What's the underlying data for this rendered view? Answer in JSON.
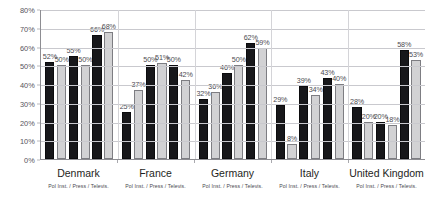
{
  "chart_data": {
    "type": "bar",
    "title": "",
    "xlabel": "",
    "ylabel": "",
    "ylim": [
      0,
      80
    ],
    "grid": true,
    "legend_position": "none",
    "categories": [
      "Denmark",
      "France",
      "Germany",
      "Italy",
      "United Kingdom"
    ],
    "subcategory_label": "Pol Inst. / Press / Televis.",
    "subcategories": [
      "Pol Inst.",
      "Press",
      "Televis."
    ],
    "series": [
      {
        "name": "Series 1",
        "style": "dark",
        "values": [
          52,
          25,
          32,
          29,
          28
        ]
      },
      {
        "name": "Series 2",
        "style": "light",
        "values": [
          50,
          37,
          36,
          8,
          20
        ]
      },
      {
        "name": "Series 3",
        "style": "dark",
        "values": [
          55,
          50,
          46,
          39,
          20
        ]
      },
      {
        "name": "Series 4",
        "style": "light",
        "values": [
          50,
          51,
          50,
          34,
          18
        ]
      },
      {
        "name": "Series 5",
        "style": "dark",
        "values": [
          66,
          50,
          62,
          43,
          58
        ]
      },
      {
        "name": "Series 6",
        "style": "light",
        "values": [
          68,
          42,
          59,
          40,
          53
        ]
      }
    ],
    "groups": [
      {
        "name": "Denmark",
        "sub_label": "Pol Inst. / Press / Televis.",
        "bars": [
          {
            "value": 52,
            "label": "52%",
            "style": "dark"
          },
          {
            "value": 50,
            "label": "50%",
            "style": "light"
          },
          {
            "value": 55,
            "label": "55%",
            "style": "dark"
          },
          {
            "value": 50,
            "label": "50%",
            "style": "light"
          },
          {
            "value": 66,
            "label": "66%",
            "style": "dark"
          },
          {
            "value": 68,
            "label": "68%",
            "style": "light"
          }
        ]
      },
      {
        "name": "France",
        "sub_label": "Pol Inst. / Press / Televis.",
        "bars": [
          {
            "value": 25,
            "label": "25%",
            "style": "dark"
          },
          {
            "value": 37,
            "label": "37%",
            "style": "light"
          },
          {
            "value": 50,
            "label": "50%",
            "style": "dark"
          },
          {
            "value": 51,
            "label": "51%",
            "style": "light"
          },
          {
            "value": 50,
            "label": "50%",
            "style": "dark"
          },
          {
            "value": 42,
            "label": "42%",
            "style": "light"
          }
        ]
      },
      {
        "name": "Germany",
        "sub_label": "Pol Inst. / Press / Televis.",
        "bars": [
          {
            "value": 32,
            "label": "32%",
            "style": "dark"
          },
          {
            "value": 36,
            "label": "36%",
            "style": "light"
          },
          {
            "value": 46,
            "label": "46%",
            "style": "dark"
          },
          {
            "value": 50,
            "label": "50%",
            "style": "light"
          },
          {
            "value": 62,
            "label": "62%",
            "style": "dark"
          },
          {
            "value": 59,
            "label": "59%",
            "style": "light"
          }
        ]
      },
      {
        "name": "Italy",
        "sub_label": "Pol Inst. / Press / Televis.",
        "bars": [
          {
            "value": 29,
            "label": "29%",
            "style": "dark"
          },
          {
            "value": 8,
            "label": "8%",
            "style": "light"
          },
          {
            "value": 39,
            "label": "39%",
            "style": "dark"
          },
          {
            "value": 34,
            "label": "34%",
            "style": "light"
          },
          {
            "value": 43,
            "label": "43%",
            "style": "dark"
          },
          {
            "value": 40,
            "label": "40%",
            "style": "light"
          }
        ]
      },
      {
        "name": "United Kingdom",
        "sub_label": "Pol Inst. / Press / Televis.",
        "bars": [
          {
            "value": 28,
            "label": "28%",
            "style": "dark"
          },
          {
            "value": 20,
            "label": "20%",
            "style": "light"
          },
          {
            "value": 20,
            "label": "20%",
            "style": "dark"
          },
          {
            "value": 18,
            "label": "18%",
            "style": "light"
          },
          {
            "value": 58,
            "label": "58%",
            "style": "dark"
          },
          {
            "value": 53,
            "label": "53%",
            "style": "light"
          }
        ]
      }
    ],
    "y_ticks": [
      "0%",
      "10%",
      "20%",
      "30%",
      "40%",
      "50%",
      "60%",
      "70%",
      "80%"
    ],
    "y_tick_values": [
      0,
      10,
      20,
      30,
      40,
      50,
      60,
      70,
      80
    ],
    "colors": {
      "bar_dark": "#17171a",
      "bar_light": "#d2d2d4",
      "gridline": "#c9c9ce",
      "axis": "#8d8d92",
      "text": "#4c4b51",
      "background": "#ffffff"
    }
  }
}
